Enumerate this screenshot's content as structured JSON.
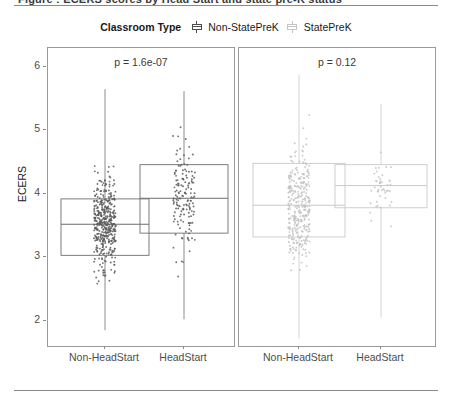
{
  "figure": {
    "clipped_header": "Figure : ECERS scores by Head Start and state pre-K status",
    "legend": {
      "title": "Classroom Type",
      "items": [
        {
          "label": "Non-StatePreK",
          "color": "#4d4d4d",
          "key_icon": "boxplot-key-icon"
        },
        {
          "label": "StatePreK",
          "color": "#c4c4c4",
          "key_icon": "boxplot-key-icon"
        }
      ]
    }
  },
  "chart_data": {
    "type": "box",
    "title": "",
    "xlabel": "",
    "ylabel": "ECERS",
    "ylim": [
      1.6,
      6.3
    ],
    "yticks": [
      2,
      3,
      4,
      5,
      6
    ],
    "ytick_labels": [
      "2",
      "3",
      "4",
      "5",
      "6"
    ],
    "grid": false,
    "legend_position": "top-center",
    "overlay": "jittered points",
    "panels": [
      {
        "name": "Non-StatePreK",
        "annotation": "p = 1.6e-07",
        "p_value": "1.6e-07",
        "point_color": "#5a5a5a",
        "categories": [
          "Non-HeadStart",
          "HeadStart"
        ],
        "boxes": [
          {
            "category": "Non-HeadStart",
            "whisker_low": 1.85,
            "q1": 3.03,
            "median": 3.52,
            "q3": 3.92,
            "whisker_high": 5.65,
            "n_points": 430
          },
          {
            "category": "HeadStart",
            "whisker_low": 2.02,
            "q1": 3.38,
            "median": 3.93,
            "q3": 4.46,
            "whisker_high": 5.62,
            "n_points": 150
          }
        ]
      },
      {
        "name": "StatePreK",
        "annotation": "p = 0.12",
        "p_value": "0.12",
        "point_color": "#c2c2c2",
        "categories": [
          "Non-HeadStart",
          "HeadStart"
        ],
        "boxes": [
          {
            "category": "Non-HeadStart",
            "whisker_low": 1.72,
            "q1": 3.32,
            "median": 3.82,
            "q3": 4.48,
            "whisker_high": 5.88,
            "n_points": 330
          },
          {
            "category": "HeadStart",
            "whisker_low": 2.05,
            "q1": 3.78,
            "median": 4.13,
            "q3": 4.46,
            "whisker_high": 5.42,
            "n_points": 45
          }
        ]
      }
    ]
  }
}
